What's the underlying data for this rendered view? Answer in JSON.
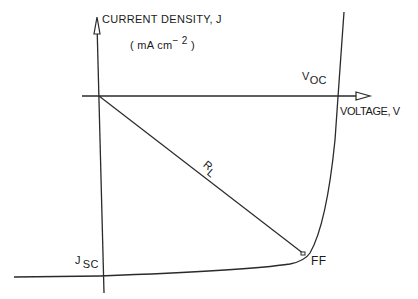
{
  "diagram": {
    "type": "solar-cell J-V characteristic",
    "y_axis": {
      "label": "CURRENT DENSITY, J",
      "unit_open": "( mA  cm",
      "unit_exp": "− 2",
      "unit_close": " )"
    },
    "x_axis": {
      "label": "VOLTAGE, V"
    },
    "annotations": {
      "voc_main": "V",
      "voc_sub": "OC",
      "jsc_main": "J",
      "jsc_sub": "SC",
      "load_line": "R",
      "load_line_sub": "L",
      "fill_factor": "FF"
    },
    "colors": {
      "line": "#2a2a2a",
      "background": "#ffffff"
    }
  }
}
